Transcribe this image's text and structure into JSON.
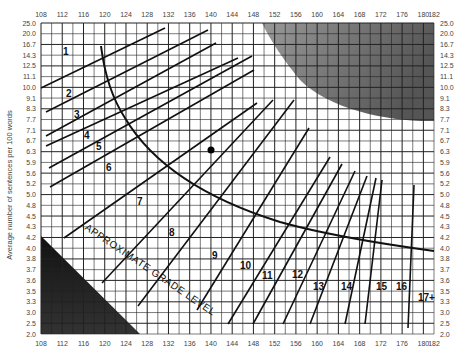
{
  "chart_data": {
    "type": "line",
    "title": "",
    "subtitle": "Fry Readability Graph",
    "xlabel": "Average number of syllables per 100 words",
    "ylabel": "Average number of sentences per 100 words",
    "x_ticks": [
      108,
      112,
      116,
      120,
      124,
      128,
      132,
      136,
      140,
      144,
      148,
      152,
      156,
      160,
      164,
      168,
      172,
      176,
      180,
      182
    ],
    "y_ticks": [
      "25.0",
      "20.0",
      "16.7",
      "14.3",
      "12.5",
      "11.1",
      "10.0",
      "9.1",
      "8.3",
      "7.7",
      "7.1",
      "6.7",
      "6.3",
      "5.9",
      "5.6",
      "5.2",
      "5.0",
      "4.8",
      "4.5",
      "4.3",
      "4.2",
      "4.0",
      "3.8",
      "3.7",
      "3.6",
      "3.5",
      "3.3",
      "3.0",
      "2.5",
      "2.0"
    ],
    "xlim": [
      108,
      182
    ],
    "grid": true,
    "curve_label": "APPROXIMATE GRADE LEVEL",
    "grade_labels": [
      "1",
      "2",
      "3",
      "4",
      "5",
      "6",
      "7",
      "8",
      "9",
      "10",
      "11",
      "12",
      "13",
      "14",
      "15",
      "16",
      "17+"
    ],
    "sample_point": {
      "x": 141,
      "y_label": "6.3"
    },
    "invalid_regions": [
      "top-right shaded (too many sentences/long words)",
      "bottom-left shaded (too few sentences/short words)"
    ],
    "series": [
      {
        "name": "1",
        "from_px": [
          41,
          88
        ],
        "to_px": [
          165,
          28
        ]
      },
      {
        "name": "2",
        "from_px": [
          46,
          112
        ],
        "to_px": [
          208,
          30
        ]
      },
      {
        "name": "3",
        "from_px": [
          46,
          136
        ],
        "to_px": [
          216,
          43
        ]
      },
      {
        "name": "4",
        "from_px": [
          46,
          146
        ],
        "to_px": [
          238,
          58
        ]
      },
      {
        "name": "5",
        "from_px": [
          49,
          168
        ],
        "to_px": [
          252,
          56
        ]
      },
      {
        "name": "6",
        "from_px": [
          50,
          187
        ],
        "to_px": [
          254,
          70
        ]
      },
      {
        "name": "7",
        "from_px": [
          64,
          238
        ],
        "to_px": [
          257,
          103
        ]
      },
      {
        "name": "8",
        "from_px": [
          102,
          283
        ],
        "to_px": [
          273,
          100
        ]
      },
      {
        "name": "9",
        "from_px": [
          138,
          306
        ],
        "to_px": [
          294,
          100
        ]
      },
      {
        "name": "10",
        "from_px": [
          197,
          310
        ],
        "to_px": [
          309,
          128
        ]
      },
      {
        "name": "11",
        "from_px": [
          228,
          324
        ],
        "to_px": [
          330,
          157
        ]
      },
      {
        "name": "12",
        "from_px": [
          253,
          324
        ],
        "to_px": [
          342,
          164
        ]
      },
      {
        "name": "13",
        "from_px": [
          283,
          324
        ],
        "to_px": [
          355,
          171
        ]
      },
      {
        "name": "14",
        "from_px": [
          310,
          324
        ],
        "to_px": [
          367,
          176
        ]
      },
      {
        "name": "15",
        "from_px": [
          345,
          324
        ],
        "to_px": [
          376,
          178
        ]
      },
      {
        "name": "16",
        "from_px": [
          365,
          324
        ],
        "to_px": [
          382,
          180
        ]
      },
      {
        "name": "17+",
        "from_px": [
          408,
          328
        ],
        "to_px": [
          414,
          185
        ]
      }
    ]
  }
}
